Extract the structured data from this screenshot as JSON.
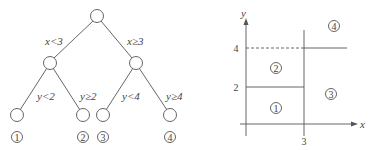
{
  "tree": {
    "root": {
      "x": 97,
      "y": 16
    },
    "internal_nodes": [
      {
        "x": 50,
        "y": 63
      },
      {
        "x": 136,
        "y": 63
      }
    ],
    "leaves": [
      {
        "x": 17,
        "y": 115,
        "label": "1"
      },
      {
        "x": 83,
        "y": 115,
        "label": "2"
      },
      {
        "x": 103,
        "y": 115,
        "label": "3"
      },
      {
        "x": 170,
        "y": 115,
        "label": "4"
      }
    ],
    "edge_labels": {
      "root_left": "x<3",
      "root_right": "x≥3",
      "left_left": "y<2",
      "left_right": "y≥2",
      "right_left": "y<4",
      "right_right": "y≥4"
    }
  },
  "partition": {
    "x_axis_label": "x",
    "y_axis_label": "y",
    "x_ticks": [
      "3"
    ],
    "y_ticks": [
      "4",
      "2"
    ],
    "regions": [
      {
        "label": "1"
      },
      {
        "label": "2"
      },
      {
        "label": "3"
      },
      {
        "label": "4"
      }
    ]
  }
}
